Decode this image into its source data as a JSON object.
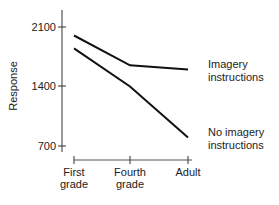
{
  "chart_data": {
    "type": "line",
    "title": "",
    "xlabel": "",
    "ylabel": "Response",
    "categories": [
      "First grade",
      "Fourth grade",
      "Adult"
    ],
    "category_lines": [
      [
        "First",
        "grade"
      ],
      [
        "Fourth",
        "grade"
      ],
      [
        "Adult",
        ""
      ]
    ],
    "yticks": [
      "2100",
      "1400",
      "700"
    ],
    "ylim": [
      700,
      2100
    ],
    "grid": false,
    "legend_position": "right, inline labels",
    "series": [
      {
        "name": "Imagery instructions",
        "label_lines": [
          "Imagery",
          "instructions"
        ],
        "values": [
          2000,
          1650,
          1600
        ]
      },
      {
        "name": "No imagery instructions",
        "label_lines": [
          "No imagery",
          "instructions"
        ],
        "values": [
          1850,
          1400,
          800
        ]
      }
    ]
  }
}
